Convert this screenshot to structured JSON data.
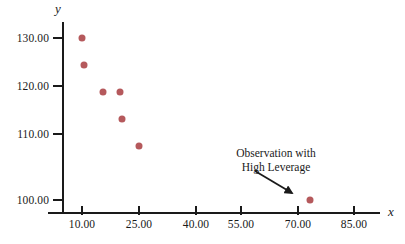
{
  "chart_data": {
    "type": "scatter",
    "title": "",
    "xlabel": "x",
    "ylabel": "y",
    "grid": false,
    "legend": "none",
    "xlim": [
      2.5,
      92.5
    ],
    "ylim": [
      96,
      134
    ],
    "x_ticks": [
      "10.00",
      "25.00",
      "40.00",
      "55.00",
      "70.00",
      "85.00"
    ],
    "x_tick_values": [
      10,
      25,
      40,
      55,
      70,
      85
    ],
    "y_ticks": [
      "130.00",
      "120.00",
      "110.00",
      "100.00"
    ],
    "y_tick_values": [
      130,
      120,
      110,
      100
    ],
    "series": [
      {
        "name": "observations",
        "color": "#b5595c",
        "points": [
          {
            "x": 10.0,
            "y": 130.0
          },
          {
            "x": 10.5,
            "y": 125.0
          },
          {
            "x": 15.5,
            "y": 120.0
          },
          {
            "x": 20.0,
            "y": 120.0
          },
          {
            "x": 20.5,
            "y": 115.0
          },
          {
            "x": 25.0,
            "y": 110.0
          },
          {
            "x": 70.0,
            "y": 100.0
          }
        ]
      }
    ],
    "annotations": [
      {
        "name": "high-leverage-callout",
        "line1": "Observation with",
        "line2": "High Leverage",
        "points_to": {
          "x": 70.0,
          "y": 100.0
        }
      }
    ]
  },
  "colors": {
    "point": "#b5595c",
    "axis": "#1a1a1a",
    "text": "#1a1a1a",
    "background": "#ffffff"
  }
}
